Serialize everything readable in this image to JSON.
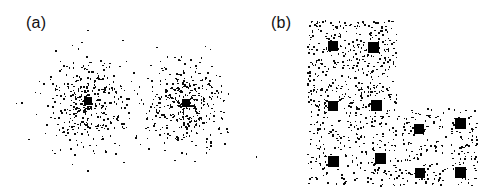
{
  "figure": {
    "width": 502,
    "height": 195,
    "background": "#ffffff",
    "point_color": "#0b0b0b",
    "centroid_color": "#000000"
  },
  "panels": [
    {
      "id": "a",
      "label": "(a)",
      "label_x": 26,
      "label_y": 14
    },
    {
      "id": "b",
      "label": "(b)",
      "label_x": 271,
      "label_y": 14
    }
  ],
  "chart_data": [
    {
      "type": "scatter",
      "panel": "a",
      "title": "(a)",
      "description": "Two isotropic Gaussian point clusters, each marked with a filled black square centroid.",
      "xlabel": "",
      "ylabel": "",
      "grid": false,
      "legend": null,
      "axes_visible": false,
      "tick_labels": [],
      "xlim": [
        20,
        245
      ],
      "ylim": [
        10,
        190
      ],
      "point_count": 760,
      "point_size_px": 1.6,
      "distribution": "gaussian",
      "clusters": [
        {
          "name": "cluster-1",
          "center_x": 88,
          "center_y": 101,
          "sigma_x": 21,
          "sigma_y": 23,
          "n_points": 380,
          "seed": 11
        },
        {
          "name": "cluster-2",
          "center_x": 186,
          "center_y": 103,
          "sigma_x": 21,
          "sigma_y": 23,
          "n_points": 380,
          "seed": 29
        }
      ],
      "centroids": [
        {
          "name": "centroid-1",
          "x": 88,
          "y": 101,
          "size": 8
        },
        {
          "name": "centroid-2",
          "x": 186,
          "y": 103,
          "size": 8
        }
      ]
    },
    {
      "type": "scatter",
      "panel": "b",
      "title": "(b)",
      "description": "Uniformly distributed points filling an L-shaped region, with ten filled black square cluster centers.",
      "xlabel": "",
      "ylabel": "",
      "grid": false,
      "legend": null,
      "axes_visible": false,
      "tick_labels": [],
      "xlim": [
        307,
        477
      ],
      "ylim": [
        20,
        185
      ],
      "point_count": 900,
      "point_size_px": 1.6,
      "distribution": "uniform",
      "regions": [
        {
          "name": "upper-block",
          "x0": 307,
          "y0": 20,
          "x1": 396,
          "y1": 108,
          "n_points": 430,
          "seed": 5
        },
        {
          "name": "lower-block",
          "x0": 307,
          "y0": 108,
          "x1": 477,
          "y1": 185,
          "n_points": 470,
          "seed": 17
        }
      ],
      "centroids": [
        {
          "name": "centroid-1",
          "x": 333,
          "y": 46,
          "size": 10
        },
        {
          "name": "centroid-2",
          "x": 373,
          "y": 47,
          "size": 11
        },
        {
          "name": "centroid-3",
          "x": 333,
          "y": 106,
          "size": 10
        },
        {
          "name": "centroid-4",
          "x": 376,
          "y": 105,
          "size": 11
        },
        {
          "name": "centroid-5",
          "x": 419,
          "y": 129,
          "size": 10
        },
        {
          "name": "centroid-6",
          "x": 460,
          "y": 123,
          "size": 11
        },
        {
          "name": "centroid-7",
          "x": 333,
          "y": 161,
          "size": 11
        },
        {
          "name": "centroid-8",
          "x": 380,
          "y": 158,
          "size": 11
        },
        {
          "name": "centroid-9",
          "x": 420,
          "y": 173,
          "size": 10
        },
        {
          "name": "centroid-10",
          "x": 460,
          "y": 172,
          "size": 11
        }
      ]
    }
  ]
}
